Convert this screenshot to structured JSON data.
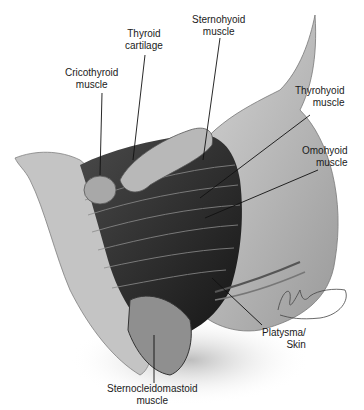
{
  "figure": {
    "type": "anatomical-illustration",
    "labels": [
      {
        "id": "thyroid-cartilage",
        "lines": [
          "Thyroid",
          "cartilage"
        ]
      },
      {
        "id": "sternohyoid-muscle",
        "lines": [
          "Sternohyoid",
          "muscle"
        ]
      },
      {
        "id": "cricothyroid-muscle",
        "lines": [
          "Cricothyroid",
          "muscle"
        ]
      },
      {
        "id": "thyrohyoid-muscle",
        "lines": [
          "Thyrohyoid",
          "muscle"
        ]
      },
      {
        "id": "omohyoid-muscle",
        "lines": [
          "Omohyoid",
          "muscle"
        ]
      },
      {
        "id": "platysma-skin",
        "lines": [
          "Platysma/",
          "Skin"
        ]
      },
      {
        "id": "sternocleidomastoid-muscle",
        "lines": [
          "Sternocleidomastoid",
          "muscle"
        ]
      }
    ],
    "signature": "artist signature"
  }
}
